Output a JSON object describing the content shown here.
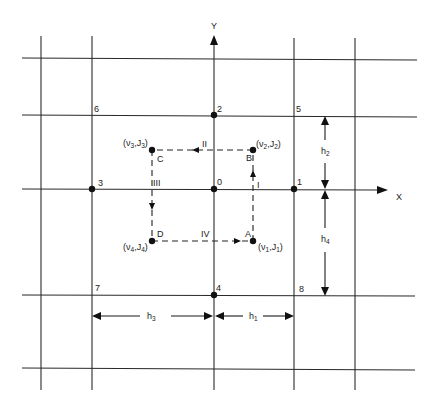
{
  "diagram": {
    "axes": {
      "x_label": "X",
      "y_label": "Y"
    },
    "grid": {
      "vertical_lines_x": [
        41,
        92,
        214,
        294,
        355
      ],
      "horizontal_lines_y": [
        58,
        115,
        189,
        295,
        369
      ]
    },
    "nodes": [
      {
        "id": "0",
        "label": "0",
        "x": 214,
        "y": 189
      },
      {
        "id": "1",
        "label": "1",
        "x": 294,
        "y": 189
      },
      {
        "id": "2",
        "label": "2",
        "x": 214,
        "y": 115
      },
      {
        "id": "3",
        "label": "3",
        "x": 92,
        "y": 189
      },
      {
        "id": "4",
        "label": "4",
        "x": 214,
        "y": 295
      },
      {
        "id": "5",
        "label": "5",
        "x": 294,
        "y": 115
      },
      {
        "id": "6",
        "label": "6",
        "x": 92,
        "y": 115
      },
      {
        "id": "7",
        "label": "7",
        "x": 92,
        "y": 295
      },
      {
        "id": "8",
        "label": "8",
        "x": 294,
        "y": 295
      }
    ],
    "flux_points": [
      {
        "label": "A",
        "coord": "(ν1,J1)",
        "var": "ν",
        "sub": "1",
        "x": 253,
        "y": 241
      },
      {
        "label": "B",
        "coord": "(ν2,J2)",
        "var": "ν",
        "sub": "2",
        "x": 253,
        "y": 150
      },
      {
        "label": "C",
        "coord": "(ν3,J3)",
        "var": "ν",
        "sub": "3",
        "x": 152,
        "y": 150
      },
      {
        "label": "D",
        "coord": "(ν4,J4)",
        "var": "ν",
        "sub": "4",
        "x": 152,
        "y": 241
      }
    ],
    "path_segments": [
      {
        "label": "I",
        "from": "A",
        "to": "B"
      },
      {
        "label": "II",
        "from": "B",
        "to": "C"
      },
      {
        "label": "III",
        "from": "C",
        "to": "D"
      },
      {
        "label": "IV",
        "from": "D",
        "to": "A"
      }
    ],
    "dimensions": [
      {
        "name": "h",
        "sub": "1",
        "label": "h1",
        "from": "4",
        "to": "8",
        "orientation": "horizontal"
      },
      {
        "name": "h",
        "sub": "2",
        "label": "h2",
        "from": "5",
        "to": "1",
        "orientation": "vertical"
      },
      {
        "name": "h",
        "sub": "3",
        "label": "h3",
        "from": "7",
        "to": "4",
        "orientation": "horizontal"
      },
      {
        "name": "h",
        "sub": "4",
        "label": "h4",
        "from": "1",
        "to": "8",
        "orientation": "vertical"
      }
    ]
  }
}
